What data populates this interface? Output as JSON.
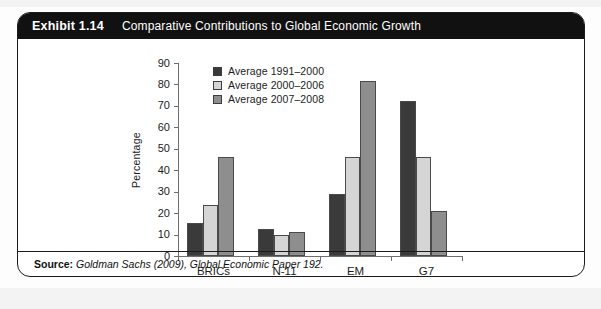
{
  "exhibit": {
    "number_label": "Exhibit 1.14",
    "title": "Comparative Contributions to Global Economic Growth"
  },
  "source": {
    "prefix": "Source:",
    "text": "Goldman Sachs (2009), Global Economic Paper 192."
  },
  "colors": {
    "series_dark": "#3a3a3a",
    "series_light": "#d5d5d5",
    "series_medium": "#8e8e8e",
    "axis": "#6e6e6e",
    "title_bar": "#111111",
    "card_border": "#1b1b1b",
    "text": "#1c1c1c"
  },
  "chart_data": {
    "type": "bar",
    "title": "Comparative Contributions to Global Economic Growth",
    "xlabel": "",
    "ylabel": "Percentage",
    "ylim": [
      0,
      90
    ],
    "ytick_step": 10,
    "yticks": [
      0,
      10,
      20,
      30,
      40,
      50,
      60,
      70,
      80,
      90
    ],
    "ytick_labels": [
      "0",
      "10",
      "20",
      "30",
      "40",
      "50",
      "60",
      "70",
      "80",
      "90"
    ],
    "grid": false,
    "legend_position": "top-left-inside",
    "categories": [
      "BRICs",
      "N-11",
      "EM",
      "G7"
    ],
    "series": [
      {
        "name": "Average 1991–2000",
        "color": "#3a3a3a",
        "values": [
          15.5,
          12.5,
          29,
          72.5
        ]
      },
      {
        "name": "Average 2000–2006",
        "color": "#d5d5d5",
        "values": [
          24,
          10,
          46,
          46
        ]
      },
      {
        "name": "Average 2007–2008",
        "color": "#8e8e8e",
        "values": [
          46,
          11,
          81.5,
          21
        ]
      }
    ]
  }
}
